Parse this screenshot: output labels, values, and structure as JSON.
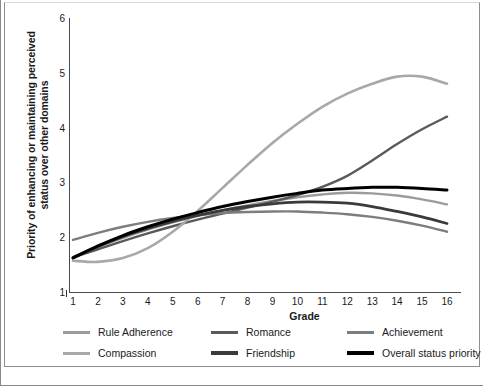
{
  "chart_data": {
    "type": "line",
    "title": "",
    "xlabel": "Grade",
    "ylabel": "Priority of enhancing or maintaining perceived status over other domains",
    "x": [
      1,
      2,
      3,
      4,
      5,
      6,
      7,
      8,
      9,
      10,
      11,
      12,
      13,
      14,
      15,
      16
    ],
    "xlim": [
      1,
      16
    ],
    "ylim": [
      1,
      6
    ],
    "yticks": [
      "6",
      "5",
      "4",
      "3",
      "2",
      "1"
    ],
    "xticks": [
      "1",
      "2",
      "3",
      "4",
      "5",
      "6",
      "7",
      "8",
      "9",
      "10",
      "11",
      "12",
      "13",
      "14",
      "15",
      "16"
    ],
    "grid": false,
    "legend_position": "bottom",
    "series": [
      {
        "name": "Rule Adherence",
        "color": "#9b9b9b",
        "values": [
          1.62,
          1.82,
          1.99,
          2.14,
          2.27,
          2.39,
          2.49,
          2.58,
          2.66,
          2.73,
          2.78,
          2.81,
          2.8,
          2.76,
          2.69,
          2.6
        ]
      },
      {
        "name": "Romance",
        "color": "#5a5a5a",
        "values": [
          1.63,
          1.78,
          1.93,
          2.07,
          2.2,
          2.32,
          2.43,
          2.54,
          2.65,
          2.77,
          2.92,
          3.12,
          3.4,
          3.7,
          3.97,
          4.2
        ]
      },
      {
        "name": "Achievement",
        "color": "#7d7d7d",
        "values": [
          1.95,
          2.08,
          2.19,
          2.28,
          2.35,
          2.4,
          2.44,
          2.46,
          2.47,
          2.47,
          2.45,
          2.42,
          2.37,
          2.3,
          2.21,
          2.1
        ]
      },
      {
        "name": "Compassion",
        "color": "#a8a8a8",
        "values": [
          1.57,
          1.55,
          1.62,
          1.8,
          2.1,
          2.48,
          2.9,
          3.32,
          3.72,
          4.07,
          4.38,
          4.62,
          4.8,
          4.93,
          4.93,
          4.8
        ]
      },
      {
        "name": "Friendship",
        "color": "#3a3a3a",
        "values": [
          1.63,
          1.83,
          2.01,
          2.16,
          2.29,
          2.4,
          2.49,
          2.56,
          2.61,
          2.64,
          2.64,
          2.62,
          2.56,
          2.47,
          2.37,
          2.25
        ]
      },
      {
        "name": "Overall status priority",
        "color": "#000000",
        "values": [
          1.62,
          1.84,
          2.03,
          2.19,
          2.33,
          2.45,
          2.56,
          2.65,
          2.73,
          2.8,
          2.86,
          2.89,
          2.91,
          2.91,
          2.89,
          2.86
        ]
      }
    ]
  },
  "axes": {
    "y_title": "Priority of enhancing or maintaining perceived status over other domains",
    "x_title": "Grade"
  },
  "legend": {
    "rows": [
      [
        {
          "label": "Rule Adherence",
          "color": "#9b9b9b",
          "thickness": 3
        },
        {
          "label": "Romance",
          "color": "#5a5a5a",
          "thickness": 3
        },
        {
          "label": "Achievement",
          "color": "#7d7d7d",
          "thickness": 3
        }
      ],
      [
        {
          "label": "Compassion",
          "color": "#a8a8a8",
          "thickness": 3
        },
        {
          "label": "Friendship",
          "color": "#3a3a3a",
          "thickness": 4
        },
        {
          "label": "Overall status priority",
          "color": "#000000",
          "thickness": 4
        }
      ]
    ]
  }
}
